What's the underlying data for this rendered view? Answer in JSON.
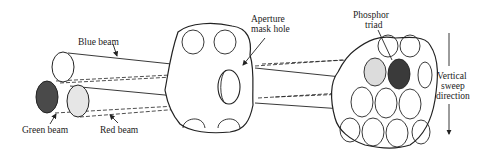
{
  "diagram": {
    "type": "CRT shadow-mask schematic",
    "labels": {
      "blue_beam": "Blue beam",
      "green_beam": "Green beam",
      "red_beam": "Red beam",
      "aperture_line1": "Aperture",
      "aperture_line2": "mask hole",
      "phosphor_line1": "Phosphor",
      "phosphor_line2": "triad",
      "sweep_line1": "Vertical",
      "sweep_line2": "sweep",
      "sweep_line3": "direction"
    },
    "colors": {
      "ink": "#222222",
      "green_beam_fill": "#4a4a4a",
      "red_beam_fill": "#e6e6e6",
      "blue_beam_fill": "#ffffff",
      "phosphor_light": "#dcdcdc",
      "phosphor_dark": "#3a3a3a"
    }
  }
}
